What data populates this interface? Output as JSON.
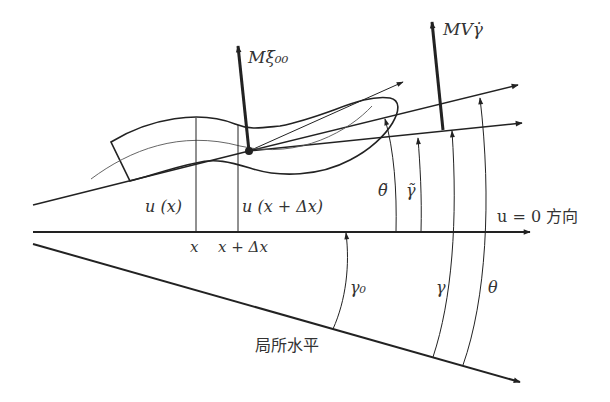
{
  "diagram": {
    "type": "aircraft/body flight-dynamics angle diagram",
    "colors": {
      "line": "#222222",
      "text": "#333333",
      "background": "#ffffff"
    },
    "labels": {
      "force_xi": "Mξ̇₀₀",
      "force_gamma": "MVγ̇",
      "u_x": "u (x)",
      "u_x_dx": "u (x + Δx)",
      "x": "x",
      "x_dx": "x + Δx",
      "theta_tilde": "θ̃",
      "gamma_tilde": "γ̃",
      "u_zero_dir": "u = 0 方向",
      "gamma0": "γ₀",
      "gamma": "γ",
      "theta": "θ",
      "local_horizontal": "局所水平"
    },
    "elements": [
      "body-shape",
      "body-centerline",
      "reference-point",
      "force-arrow-xi",
      "force-arrow-gamma",
      "u-zero-axis",
      "local-horizontal-line",
      "theta-tilde-line",
      "gamma-tilde-line",
      "angle-arc-theta-tilde",
      "angle-arc-gamma-tilde",
      "angle-arc-gamma",
      "angle-arc-theta",
      "angle-arc-gamma0"
    ]
  }
}
